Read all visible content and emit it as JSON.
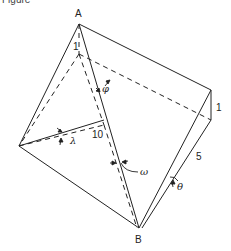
{
  "caption_fragment": "Figure",
  "vertices": {
    "top": "A",
    "bottom": "B"
  },
  "dimensions": {
    "inner_height": "1",
    "right_height": "1",
    "length": "10",
    "slant": "5"
  },
  "angles": {
    "phi": "φ",
    "lambda": "λ",
    "omega": "ω",
    "theta": "θ"
  },
  "colors": {
    "line": "#222222",
    "background": "#ffffff"
  }
}
